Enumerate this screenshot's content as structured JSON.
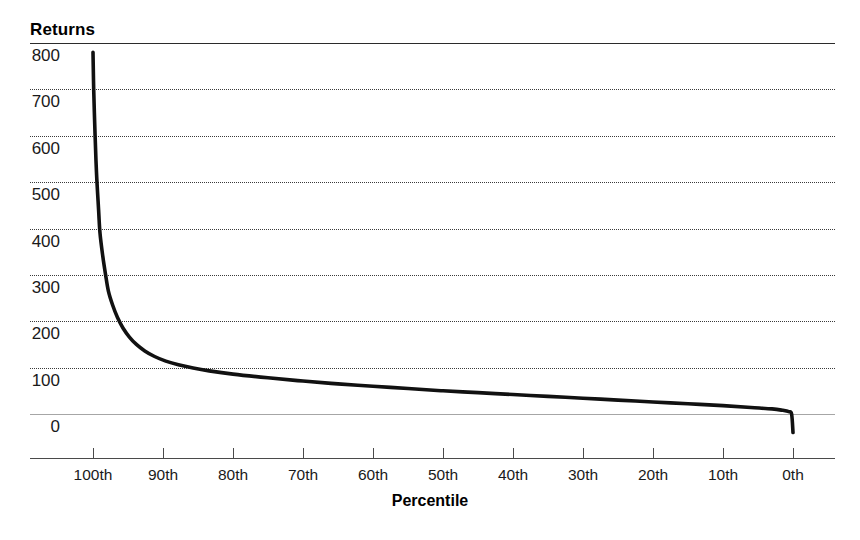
{
  "chart_data": {
    "type": "line",
    "title": "",
    "ylabel": "Returns",
    "xlabel": "Percentile",
    "ylim": [
      0,
      800
    ],
    "xlim": [
      100,
      0
    ],
    "grid": "horizontal-dotted",
    "legend": "none",
    "y_ticks": [
      {
        "label": "800",
        "value": 800
      },
      {
        "label": "700",
        "value": 700
      },
      {
        "label": "600",
        "value": 600
      },
      {
        "label": "500",
        "value": 500
      },
      {
        "label": "400",
        "value": 400
      },
      {
        "label": "300",
        "value": 300
      },
      {
        "label": "200",
        "value": 200
      },
      {
        "label": "100",
        "value": 100
      },
      {
        "label": "0",
        "value": 0
      }
    ],
    "x_ticks": [
      {
        "label": "100th",
        "value": 100
      },
      {
        "label": "90th",
        "value": 90
      },
      {
        "label": "80th",
        "value": 80
      },
      {
        "label": "70th",
        "value": 70
      },
      {
        "label": "60th",
        "value": 60
      },
      {
        "label": "50th",
        "value": 50
      },
      {
        "label": "40th",
        "value": 40
      },
      {
        "label": "30th",
        "value": 30
      },
      {
        "label": "20th",
        "value": 20
      },
      {
        "label": "10th",
        "value": 10
      },
      {
        "label": "0th",
        "value": 0
      }
    ],
    "series": [
      {
        "name": "Returns by percentile",
        "x": [
          100.0,
          99.9,
          99.7,
          99.5,
          99.2,
          99.0,
          98.6,
          98.2,
          97.8,
          97.2,
          96.5,
          95.7,
          94.8,
          93.8,
          92.6,
          91.2,
          89.6,
          87.8,
          85.7,
          83.4,
          80.0,
          75.0,
          70.0,
          65.0,
          60.0,
          55.0,
          50.0,
          45.0,
          40.0,
          35.0,
          30.0,
          25.0,
          20.0,
          15.0,
          10.0,
          6.0,
          3.0,
          1.5,
          0.6,
          0.2,
          0.0
        ],
        "y": [
          780,
          700,
          600,
          520,
          440,
          390,
          340,
          300,
          265,
          235,
          208,
          185,
          166,
          150,
          136,
          124,
          114,
          106,
          99,
          93,
          86,
          78,
          71,
          65,
          60,
          55,
          50,
          46,
          42,
          38,
          34,
          30,
          26,
          22,
          18,
          14,
          11,
          8,
          5,
          0,
          -40
        ]
      }
    ],
    "annotations": []
  },
  "axes": {
    "y_title": "Returns",
    "x_title": "Percentile"
  }
}
